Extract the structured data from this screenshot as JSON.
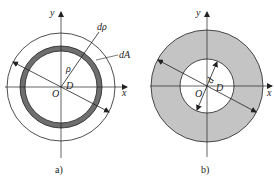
{
  "figure_a": {
    "caption": "a)",
    "labels": {
      "y": "y",
      "x": "x",
      "origin": "O",
      "diameter": "D",
      "rho": "ρ",
      "d_rho": "dρ",
      "d_area": "dA"
    },
    "colors": {
      "ring_fill": "#6e6e6e",
      "stroke": "#222222"
    }
  },
  "figure_b": {
    "caption": "b)",
    "labels": {
      "y": "y",
      "x": "x",
      "origin": "O",
      "outer_diameter": "D",
      "inner_diameter": "d"
    },
    "colors": {
      "annulus_fill": "#c4c4c4",
      "stroke": "#222222"
    }
  }
}
